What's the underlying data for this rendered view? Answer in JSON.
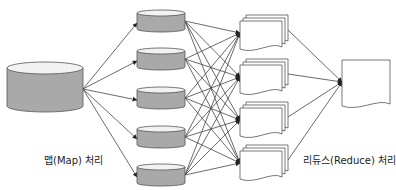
{
  "title_partial": "",
  "labels": {
    "map": "맵(Map) 처리",
    "reduce": "리듀스(Reduce) 처리"
  },
  "colors": {
    "cylinder_fill": "#a9a9a9",
    "cylinder_top": "#f2f2f2",
    "stroke": "#555555",
    "arrow": "#333333",
    "doc_fill": "#ffffff"
  },
  "nodes": {
    "source": {
      "type": "cylinder",
      "x": 7,
      "y": 62,
      "w": 76,
      "h": 50
    },
    "map_outputs": [
      {
        "type": "cylinder",
        "x": 137,
        "y": 10,
        "w": 48,
        "h": 22
      },
      {
        "type": "cylinder",
        "x": 137,
        "y": 48,
        "w": 48,
        "h": 22
      },
      {
        "type": "cylinder",
        "x": 137,
        "y": 87,
        "w": 48,
        "h": 22
      },
      {
        "type": "cylinder",
        "x": 137,
        "y": 126,
        "w": 48,
        "h": 22
      },
      {
        "type": "cylinder",
        "x": 137,
        "y": 164,
        "w": 48,
        "h": 22
      }
    ],
    "shuffle_outputs": [
      {
        "type": "doc-stack",
        "x": 240,
        "y": 18
      },
      {
        "type": "doc-stack",
        "x": 240,
        "y": 62
      },
      {
        "type": "doc-stack",
        "x": 240,
        "y": 105
      },
      {
        "type": "doc-stack",
        "x": 240,
        "y": 148
      }
    ],
    "result": {
      "type": "document",
      "x": 342,
      "y": 60,
      "w": 48,
      "h": 48
    }
  }
}
